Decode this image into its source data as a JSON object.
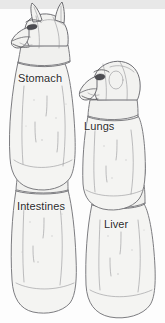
{
  "image": {
    "title": "Canopic Jars of Ancient Egypt",
    "medium": "pencil sketch illustration",
    "background_color": "#fdfdfd",
    "top_band_color": "#e8e8e8",
    "ink_color": "#6e6e73",
    "label_color": "#2b2b2b"
  },
  "labels": [
    {
      "id": "stomach",
      "text": "Stomach",
      "x": 18,
      "y": 72
    },
    {
      "id": "lungs",
      "text": "Lungs",
      "x": 84,
      "y": 120
    },
    {
      "id": "intestines",
      "text": "Intestines",
      "x": 17,
      "y": 200
    },
    {
      "id": "liver",
      "text": "Liver",
      "x": 104,
      "y": 218
    }
  ],
  "jars": [
    {
      "id": "duamutef",
      "organ": "Stomach",
      "head": "jackal-head",
      "head_description": "jackal (Anubis-like) head with two tall pointed ears",
      "position": "upper-left",
      "label_ref": "stomach"
    },
    {
      "id": "hapi",
      "organ": "Lungs",
      "head": "baboon-head",
      "head_description": "baboon / ape head facing left with muzzle",
      "position": "upper-right",
      "label_ref": "lungs"
    },
    {
      "id": "qebehsenuef",
      "organ": "Intestines",
      "head": "falcon-head",
      "head_description": "falcon head with hooked beak facing left",
      "position": "lower-left",
      "label_ref": "intestines"
    },
    {
      "id": "imsety",
      "organ": "Liver",
      "head": "human-head",
      "head_description": "human head in nemes headdress facing left",
      "position": "lower-right",
      "label_ref": "liver"
    }
  ]
}
